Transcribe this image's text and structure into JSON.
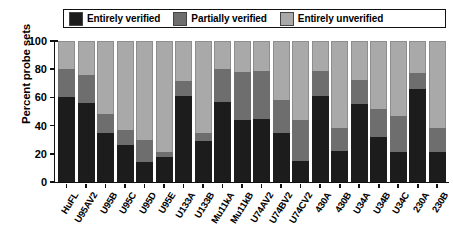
{
  "chart_data": {
    "type": "bar",
    "title": "",
    "subtitle": "",
    "xlabel": "",
    "ylabel": "Percent probe sets",
    "ylim": [
      0,
      100
    ],
    "yticks": [
      0,
      20,
      40,
      60,
      80,
      100
    ],
    "grid": false,
    "stacked": true,
    "stacked_total": 100,
    "legend_position": "top",
    "categories": [
      "HuFL",
      "U95AV2",
      "U95B",
      "U95C",
      "U95D",
      "U95E",
      "U133A",
      "U133B",
      "Mu11kA",
      "Mu11kB",
      "U74AV2",
      "U74BV2",
      "U74CV2",
      "430A",
      "430B",
      "U34A",
      "U34B",
      "U34C",
      "230A",
      "230B"
    ],
    "series": [
      {
        "name": "Entirely verified",
        "color": "#1c1c1c",
        "values": [
          60,
          56,
          35,
          26,
          14,
          18,
          61,
          29,
          57,
          44,
          45,
          35,
          15,
          61,
          22,
          55,
          32,
          21,
          66,
          21
        ]
      },
      {
        "name": "Partially verified",
        "color": "#6e6e6e",
        "values": [
          20,
          20,
          13,
          11,
          16,
          3,
          11,
          6,
          23,
          34,
          34,
          23,
          29,
          18,
          16,
          17,
          20,
          26,
          11,
          17
        ]
      },
      {
        "name": "Entirely unverified",
        "color": "#a9a9a9",
        "values": [
          20,
          24,
          52,
          63,
          70,
          79,
          28,
          65,
          20,
          22,
          21,
          42,
          56,
          21,
          62,
          28,
          48,
          53,
          23,
          62
        ]
      }
    ]
  },
  "legend": {
    "entries": [
      {
        "label": "Entirely verified",
        "color": "#1c1c1c"
      },
      {
        "label": "Partially verified",
        "color": "#6e6e6e"
      },
      {
        "label": "Entirely unverified",
        "color": "#a9a9a9"
      }
    ]
  },
  "axes": {
    "ylabel": "Percent probe sets",
    "yticks": [
      "100",
      "80",
      "60",
      "40",
      "20",
      "0"
    ]
  }
}
